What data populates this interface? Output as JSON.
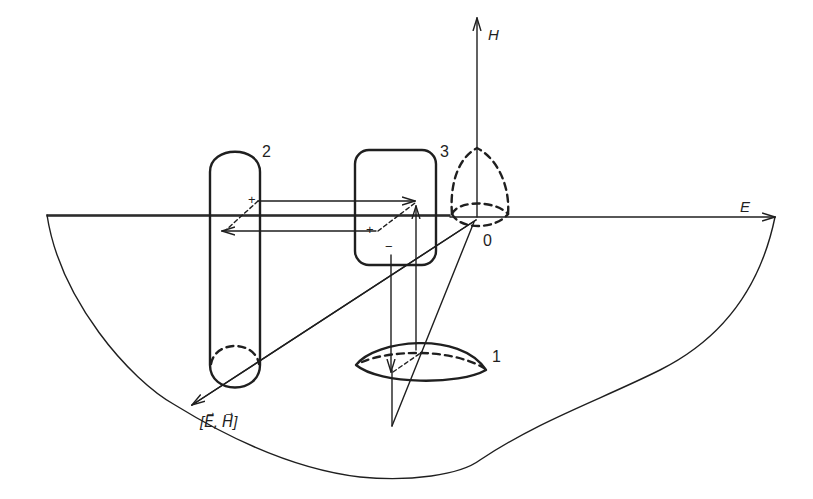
{
  "diagram": {
    "axes": {
      "h_label": "H",
      "e_label": "E",
      "origin_label": "0",
      "poynting_label": "[E⃗, H⃗]"
    },
    "objects": [
      {
        "id": "1",
        "label": "1",
        "shape": "lens"
      },
      {
        "id": "2",
        "label": "2",
        "shape": "cylinder"
      },
      {
        "id": "3",
        "label": "3",
        "shape": "rounded-box"
      }
    ],
    "charges": {
      "plus_2": "+",
      "plus_3": "+",
      "minus_3": "−"
    },
    "colors": {
      "ink": "#1f1f1f",
      "background": "#ffffff"
    }
  }
}
